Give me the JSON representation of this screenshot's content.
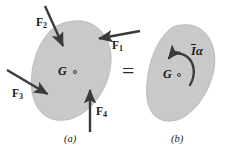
{
  "figure": {
    "caption_a": "(a)",
    "caption_b": "(b)",
    "equals_sign": "=",
    "colors": {
      "body_fill": "#c9c9c9",
      "body_stroke": "#b4b4b4",
      "arrow": "#3a3a3a",
      "text": "#1a1a1a",
      "background": "#ffffff"
    }
  },
  "panel_a": {
    "name": "free-body-diagram",
    "center_of_mass": {
      "label": "G",
      "marker": "open-circle"
    },
    "forces": [
      {
        "id": "F1",
        "label": "F",
        "subscript": "1",
        "direction": "left-and-slightly-up",
        "tail": [
          140,
          31
        ],
        "head": [
          97,
          39
        ]
      },
      {
        "id": "F2",
        "label": "F",
        "subscript": "2",
        "direction": "down-and-right",
        "tail": [
          45,
          6
        ],
        "head": [
          64,
          48
        ]
      },
      {
        "id": "F3",
        "label": "F",
        "subscript": "3",
        "direction": "down-and-right",
        "tail": [
          7,
          70
        ],
        "head": [
          49,
          95
        ]
      },
      {
        "id": "F4",
        "label": "F",
        "subscript": "4",
        "direction": "up",
        "tail": [
          90,
          132
        ],
        "head": [
          90,
          88
        ]
      }
    ]
  },
  "panel_b": {
    "name": "kinetic-diagram",
    "center_of_mass": {
      "label": "G",
      "marker": "open-circle"
    },
    "couple": {
      "symbol_I": "I",
      "symbol_alpha": "α",
      "full_label": "Iα",
      "overbar": true,
      "sense": "counterclockwise",
      "description": "inertial-couple-moment"
    }
  }
}
